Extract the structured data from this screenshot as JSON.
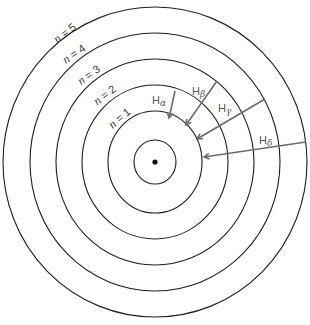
{
  "diagram": {
    "center": {
      "x": 155,
      "y": 162
    },
    "nucleus": {
      "radius": 2.6
    },
    "core_orbit": {
      "rx": 21,
      "ry": 22
    },
    "orbits": [
      {
        "n": "1",
        "label_prefix": "n",
        "label_eq": " = ",
        "rx": 47,
        "ry": 51,
        "label_x": 122,
        "label_y": 121,
        "label_rot": -40
      },
      {
        "n": "2",
        "label_prefix": "n",
        "label_eq": " = ",
        "rx": 73,
        "ry": 77,
        "label_x": 107,
        "label_y": 98,
        "label_rot": -38
      },
      {
        "n": "3",
        "label_prefix": "n",
        "label_eq": " = ",
        "rx": 99,
        "ry": 103,
        "label_x": 91,
        "label_y": 78,
        "label_rot": -36
      },
      {
        "n": "4",
        "label_prefix": "n",
        "label_eq": " = ",
        "rx": 125,
        "ry": 129,
        "label_x": 76,
        "label_y": 57,
        "label_rot": -34
      },
      {
        "n": "5",
        "label_prefix": "n",
        "label_eq": " = ",
        "rx": 152,
        "ry": 155,
        "label_x": 67,
        "label_y": 36,
        "label_rot": -38
      }
    ],
    "transitions": [
      {
        "name": "H-alpha",
        "base": "H",
        "sub": "α",
        "from_n": "3",
        "to_n": "2",
        "x1": 175,
        "y1": 91,
        "x2": 169,
        "y2": 118,
        "label_x": 152,
        "label_y": 104
      },
      {
        "name": "H-beta",
        "base": "H",
        "sub": "β",
        "from_n": "4",
        "to_n": "2",
        "x1": 217,
        "y1": 81,
        "x2": 186,
        "y2": 125,
        "label_x": 192,
        "label_y": 95
      },
      {
        "name": "H-gamma",
        "base": "H",
        "sub": "γ",
        "from_n": "5",
        "to_n": "2",
        "x1": 265,
        "y1": 99,
        "x2": 197,
        "y2": 139,
        "label_x": 218,
        "label_y": 112
      },
      {
        "name": "H-delta",
        "base": "H",
        "sub": "δ",
        "from_n": "6",
        "to_n": "2",
        "x1": 306,
        "y1": 142,
        "x2": 204,
        "y2": 157,
        "label_x": 259,
        "label_y": 144
      }
    ],
    "colors": {
      "orbit": "#1e1e1e",
      "arrow": "#6b6b6b",
      "label": "#555555",
      "background": "#ffffff"
    }
  }
}
